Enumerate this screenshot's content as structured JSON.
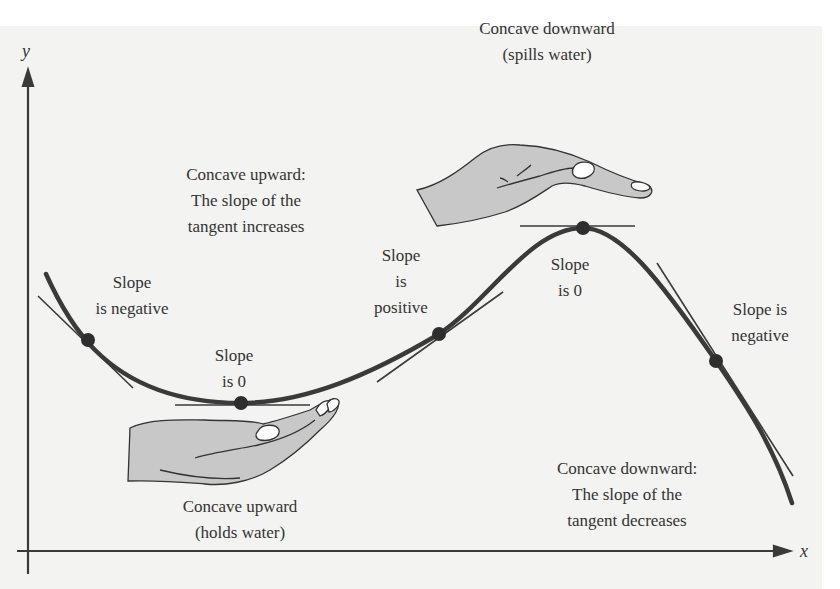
{
  "axes": {
    "x_label": "x",
    "y_label": "y"
  },
  "colors": {
    "background": "#f3f3f2",
    "curve": "#3a3a3a",
    "hand_fill": "#c8c8c8",
    "text": "#333333"
  },
  "labels": {
    "concave_down_top": {
      "line1": "Concave downward",
      "line2": "(spills water)"
    },
    "concave_up_top": {
      "line1": "Concave upward:",
      "line2": "The slope of the",
      "line3": "tangent increases"
    },
    "slope_negative_left": {
      "line1": "Slope",
      "line2": "is negative"
    },
    "slope_zero_min": {
      "line1": "Slope",
      "line2": "is 0"
    },
    "slope_positive": {
      "line1": "Slope",
      "line2": "is",
      "line3": "positive"
    },
    "slope_zero_max": {
      "line1": "Slope",
      "line2": "is 0"
    },
    "slope_negative_right": {
      "line1": "Slope is",
      "line2": "negative"
    },
    "concave_up_bottom": {
      "line1": "Concave upward",
      "line2": "(holds water)"
    },
    "concave_down_bottom": {
      "line1": "Concave downward:",
      "line2": "The slope of the",
      "line3": "tangent decreases"
    }
  },
  "points": [
    {
      "name": "negative-slope-left",
      "x": 88,
      "y": 340
    },
    {
      "name": "minimum",
      "x": 241,
      "y": 403
    },
    {
      "name": "positive-slope",
      "x": 439,
      "y": 334
    },
    {
      "name": "maximum",
      "x": 583,
      "y": 228
    },
    {
      "name": "negative-slope-right",
      "x": 716,
      "y": 361
    }
  ]
}
